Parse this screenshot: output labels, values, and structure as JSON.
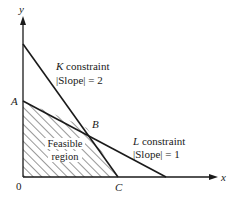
{
  "diagram": {
    "type": "linear-programming-feasible-region",
    "axes": {
      "x_label": "x",
      "y_label": "y",
      "origin_label": "0"
    },
    "points": {
      "A": "A",
      "B": "B",
      "C": "C"
    },
    "constraints": [
      {
        "name_letter": "K",
        "name_rest": " constraint",
        "slope_text": "|Slope| = 2"
      },
      {
        "name_letter": "L",
        "name_rest": " constraint",
        "slope_text": "|Slope| = 1"
      }
    ],
    "region": {
      "line1": "Feasible",
      "line2": "region"
    },
    "colors": {
      "ink": "#1a1a1a",
      "background": "#ffffff"
    }
  }
}
